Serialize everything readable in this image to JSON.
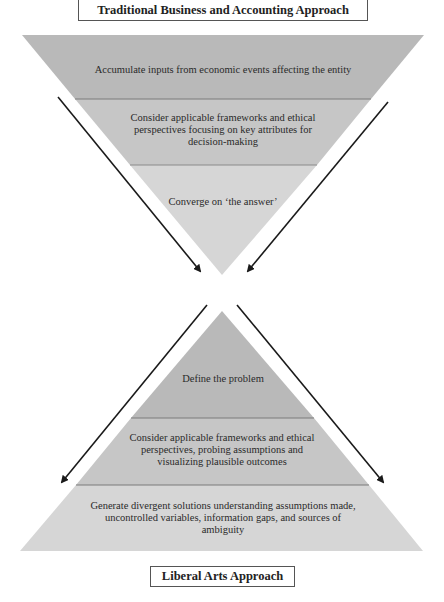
{
  "diagram": {
    "top_title": "Traditional Business and Accounting Approach",
    "bottom_title": "Liberal Arts Approach",
    "top_funnel": {
      "shape": "inverted-triangle",
      "bands": [
        {
          "label": "Accumulate inputs from economic events affecting the entity",
          "color": "#b9b9b9"
        },
        {
          "label": "Consider applicable frameworks and ethical perspectives focusing on key attributes for decision-making",
          "color": "#c6c6c6"
        },
        {
          "label": "Converge on ‘the answer’",
          "color": "#d6d6d6"
        }
      ]
    },
    "bottom_pyramid": {
      "shape": "triangle",
      "bands": [
        {
          "label": "Define the problem",
          "color": "#b9b9b9"
        },
        {
          "label": "Consider applicable frameworks and ethical perspectives, probing assumptions and visualizing plausible outcomes",
          "color": "#c6c6c6"
        },
        {
          "label": "Generate divergent solutions understanding assumptions made, uncontrolled variables, information gaps, and sources of ambiguity",
          "color": "#d6d6d6"
        }
      ]
    },
    "arrows": [
      {
        "name": "top-left-converging-arrow",
        "direction": "down-right"
      },
      {
        "name": "top-right-converging-arrow",
        "direction": "down-left"
      },
      {
        "name": "bottom-left-diverging-arrow",
        "direction": "down-left"
      },
      {
        "name": "bottom-right-diverging-arrow",
        "direction": "down-right"
      }
    ],
    "colors": {
      "outline": "#555555",
      "arrow": "#1a1a1a",
      "band_divider": "#7a7a7a"
    }
  }
}
